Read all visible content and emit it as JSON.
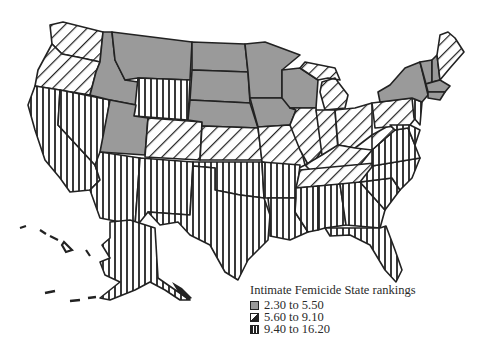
{
  "map": {
    "region": "United States",
    "legend": {
      "title": "Intimate Femicide State rankings",
      "classes": [
        {
          "label": "2.30 to 5.50",
          "fill": "gray",
          "color": "#9a9a9a"
        },
        {
          "label": "5.60 to 9.10",
          "fill": "diagonal-hatch",
          "color": "#222222"
        },
        {
          "label": "9.40 to 16.20",
          "fill": "vertical-hatch",
          "color": "#222222"
        }
      ]
    },
    "states": {
      "gray": [
        "Montana",
        "Idaho",
        "Wyoming-none",
        "North Dakota",
        "South Dakota",
        "Nebraska",
        "Minnesota",
        "Iowa",
        "Wisconsin",
        "Utah",
        "New York",
        "Vermont",
        "New Hampshire",
        "Massachusetts",
        "Connecticut",
        "Rhode Island"
      ],
      "diagonal": [
        "Washington",
        "Oregon",
        "Colorado",
        "Kansas",
        "Missouri",
        "Illinois",
        "Indiana",
        "Ohio",
        "Michigan",
        "Kentucky",
        "Pennsylvania",
        "West Virginia",
        "Maine",
        "Tennessee",
        "Arkansas-north"
      ],
      "vertical": [
        "California",
        "Nevada",
        "Arizona",
        "New Mexico",
        "Texas",
        "Oklahoma",
        "Louisiana",
        "Mississippi",
        "Alabama",
        "Georgia",
        "Florida",
        "South Carolina",
        "North Carolina",
        "Virginia",
        "Maryland",
        "Arkansas",
        "Wyoming",
        "Alaska"
      ]
    }
  }
}
